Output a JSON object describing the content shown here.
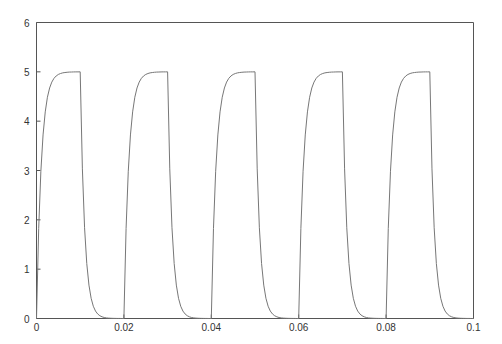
{
  "chart_data": {
    "type": "line",
    "title": "",
    "xlabel": "",
    "ylabel": "",
    "xlim": [
      0,
      0.1
    ],
    "ylim": [
      0,
      6
    ],
    "grid": false,
    "legend": null,
    "x_ticks": [
      {
        "value": 0,
        "label": "0"
      },
      {
        "value": 0.02,
        "label": "0.02"
      },
      {
        "value": 0.04,
        "label": "0.04"
      },
      {
        "value": 0.06,
        "label": "0.06"
      },
      {
        "value": 0.08,
        "label": "0.08"
      },
      {
        "value": 0.1,
        "label": "0.1"
      }
    ],
    "y_ticks": [
      {
        "value": 0,
        "label": "0"
      },
      {
        "value": 1,
        "label": "1"
      },
      {
        "value": 2,
        "label": "2"
      },
      {
        "value": 3,
        "label": "3"
      },
      {
        "value": 4,
        "label": "4"
      },
      {
        "value": 5,
        "label": "5"
      },
      {
        "value": 6,
        "label": "6"
      }
    ],
    "period": 0.02,
    "periods": 5,
    "sample_step": 0.0005,
    "period_profile": [
      0,
      1.826,
      2.985,
      3.721,
      4.188,
      4.485,
      4.673,
      4.792,
      4.868,
      4.916,
      4.947,
      4.966,
      4.979,
      4.986,
      4.991,
      4.995,
      4.996,
      4.998,
      4.999,
      4.999,
      5.0,
      3.033,
      1.839,
      1.116,
      0.677,
      0.41,
      0.249,
      0.151,
      0.092,
      0.056,
      0.034,
      0.02,
      0.012,
      0.008,
      0.005,
      0.003,
      0.002,
      0.001,
      0.001,
      0,
      0
    ],
    "series": [
      {
        "name": "response",
        "color": "#777777"
      }
    ]
  },
  "colors": {
    "axis": "#555555",
    "line": "#777777",
    "background": "#ffffff"
  }
}
